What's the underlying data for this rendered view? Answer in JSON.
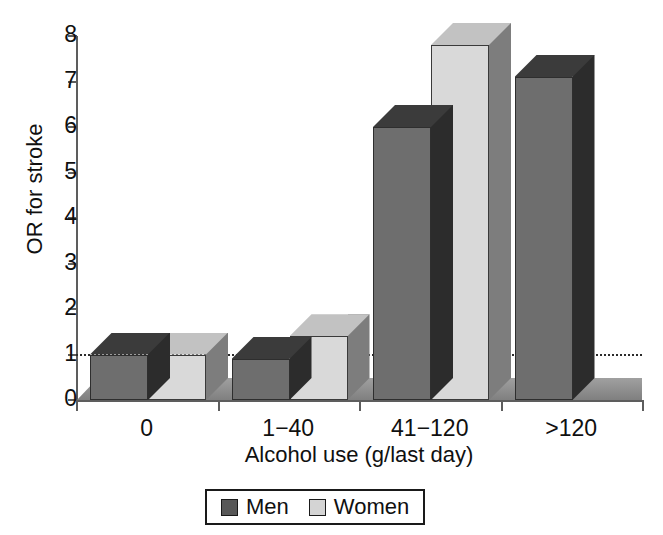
{
  "chart_data": {
    "type": "bar",
    "title": "",
    "subtitle": "",
    "xlabel": "Alcohol use (g/last day)",
    "ylabel": "OR for stroke",
    "categories": [
      "0",
      "1−40",
      "41−120",
      ">120"
    ],
    "series": [
      {
        "name": "Men",
        "values": [
          1.0,
          0.9,
          6.0,
          7.1
        ]
      },
      {
        "name": "Women",
        "values": [
          1.0,
          1.4,
          7.8,
          null
        ]
      }
    ],
    "ylim": [
      0,
      8
    ],
    "ytick_labels": [
      "0",
      "1",
      "2",
      "3",
      "4",
      "5",
      "6",
      "7",
      "8"
    ],
    "ytick_values": [
      0,
      1,
      2,
      3,
      4,
      5,
      6,
      7,
      8
    ],
    "grid": false,
    "legend_position": "bottom-center",
    "annotations": [
      {
        "name": "reference-line",
        "type": "hline",
        "value": 1,
        "style": "dotted",
        "color": "#2b2b2b"
      }
    ],
    "style": "3d-bars",
    "colors": {
      "men_front": "#6e6e6e",
      "men_top": "#3b3b3b",
      "men_side": "#2c2c2c",
      "women_front": "#d9d9d9",
      "women_top": "#c2c2c2",
      "women_side": "#7d7d7d",
      "floor": "#8c8c8c",
      "axis": "#5d5d5d",
      "text": "#101010"
    }
  },
  "legend": {
    "entries": [
      {
        "label": "Men",
        "swatch": "men-swatch-icon"
      },
      {
        "label": "Women",
        "swatch": "women-swatch-icon"
      }
    ]
  }
}
